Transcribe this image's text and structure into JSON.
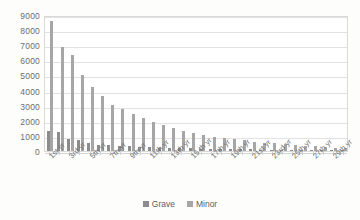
{
  "chart_data": {
    "type": "bar",
    "title": "",
    "xlabel": "",
    "ylabel": "",
    "ylim": [
      0,
      9000
    ],
    "ytick_step": 1000,
    "yticks": [
      "0",
      "1000",
      "2000",
      "3000",
      "4000",
      "5000",
      "6000",
      "7000",
      "8000",
      "9000"
    ],
    "grid": true,
    "legend_position": "bottom-center",
    "categories": [
      "1st yr",
      "2nd yr",
      "3rd yr",
      "4th yr",
      "5th yr",
      "6th yr",
      "7th yr",
      "8th yr",
      "9th yr",
      "10th yr",
      "11th yr",
      "12th yr",
      "13th yr",
      "14th yr",
      "15 th yr",
      "16th yr",
      "17th yr",
      "18th yr",
      "19th yr",
      "20th yr",
      "21st yr",
      "22nd yr",
      "23rd yr",
      "24th yr",
      "25th yr",
      "26th yr",
      "27th yr",
      "28th yr",
      "29th yr",
      "30th yr"
    ],
    "visible_tick_labels": [
      "1st yr",
      "3rd yr",
      "5th yr",
      "7th yr",
      "9th yr",
      "11th yr",
      "13th yr",
      "15 th yr",
      "17th yr",
      "19th yr",
      "21st yr",
      "23rd yr",
      "25th yr",
      "27th yr",
      "29th yr"
    ],
    "series": [
      {
        "name": "Grave",
        "color": "#8c8c8c",
        "values": [
          1300,
          1250,
          800,
          700,
          550,
          420,
          380,
          340,
          300,
          280,
          250,
          230,
          210,
          195,
          180,
          165,
          150,
          140,
          130,
          120,
          110,
          100,
          90,
          80,
          70,
          60,
          55,
          50,
          45,
          40
        ]
      },
      {
        "name": "Minor",
        "color": "#a6a6a6",
        "values": [
          8600,
          6900,
          6350,
          5000,
          4250,
          3650,
          3050,
          2800,
          2450,
          2200,
          1950,
          1700,
          1500,
          1350,
          1200,
          1050,
          950,
          850,
          780,
          700,
          620,
          560,
          500,
          450,
          400,
          350,
          300,
          260,
          220,
          180
        ]
      }
    ]
  },
  "legend": {
    "entries": [
      {
        "label": "Grave",
        "color": "#8c8c8c"
      },
      {
        "label": "Minor",
        "color": "#a6a6a6"
      }
    ]
  }
}
